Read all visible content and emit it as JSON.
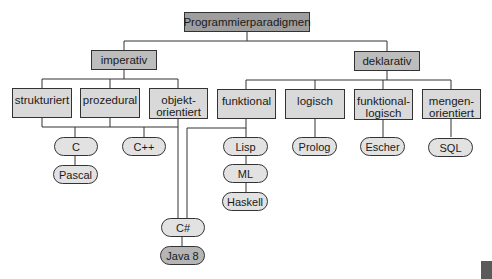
{
  "diagram": {
    "title": "Programmierparadigmen",
    "branches": [
      {
        "label": "imperativ",
        "children": [
          {
            "label": "strukturiert"
          },
          {
            "label": "prozedural"
          },
          {
            "label": "objekt-\norientiert"
          }
        ]
      },
      {
        "label": "deklarativ",
        "children": [
          {
            "label": "funktional"
          },
          {
            "label": "logisch"
          },
          {
            "label": "funktional-\nlogisch"
          },
          {
            "label": "mengen-\norientiert"
          }
        ]
      }
    ],
    "languages": {
      "c": "C",
      "pascal": "Pascal",
      "cpp": "C++",
      "csharp": "C#",
      "java8": "Java 8",
      "lisp": "Lisp",
      "ml": "ML",
      "haskell": "Haskell",
      "prolog": "Prolog",
      "escher": "Escher",
      "sql": "SQL"
    },
    "colors": {
      "root_fill": "#9e9e9e",
      "category_fill": "#bdbdbd",
      "paradigm_fill": "#d9d9d9",
      "language_fill": "#e2e2e2",
      "java8_fill": "#b5b5b5",
      "line": "#333333"
    }
  }
}
